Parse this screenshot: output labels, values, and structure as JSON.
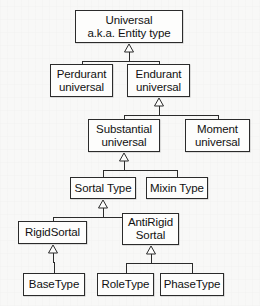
{
  "diagram": {
    "notation": "UML generalization hierarchy",
    "background_color": "#f8f8f7",
    "node_fill_color": "#fdfdfc",
    "line_color": "#2b2b2b",
    "text_color": "#111111",
    "nodes": [
      {
        "id": "universal",
        "lines": [
          "Universal",
          "a.k.a. Entity type"
        ],
        "x": 75,
        "y": 10,
        "w": 108,
        "h": 33,
        "font_size": 11.5
      },
      {
        "id": "perdurant",
        "lines": [
          "Perdurant",
          "universal"
        ],
        "x": 50,
        "y": 64,
        "w": 63,
        "h": 33,
        "font_size": 11.5
      },
      {
        "id": "endurant",
        "lines": [
          "Endurant",
          "universal"
        ],
        "x": 127,
        "y": 64,
        "w": 63,
        "h": 33,
        "font_size": 11.5
      },
      {
        "id": "substantial",
        "lines": [
          "Substantial",
          "universal"
        ],
        "x": 88,
        "y": 119,
        "w": 72,
        "h": 33,
        "font_size": 11.5
      },
      {
        "id": "moment",
        "lines": [
          "Moment",
          "universal"
        ],
        "x": 185,
        "y": 119,
        "w": 65,
        "h": 33,
        "font_size": 11.5
      },
      {
        "id": "sortal-type",
        "lines": [
          "Sortal Type"
        ],
        "x": 70,
        "y": 177,
        "w": 66,
        "h": 22,
        "font_size": 11.5
      },
      {
        "id": "mixin-type",
        "lines": [
          "Mixin Type"
        ],
        "x": 146,
        "y": 177,
        "w": 62,
        "h": 22,
        "font_size": 11.5
      },
      {
        "id": "rigid-sortal",
        "lines": [
          "RigidSortal"
        ],
        "x": 18,
        "y": 221,
        "w": 69,
        "h": 23,
        "font_size": 11.5
      },
      {
        "id": "antirigid-sortal",
        "lines": [
          "AntiRigid",
          "Sortal"
        ],
        "x": 122,
        "y": 213,
        "w": 57,
        "h": 32,
        "font_size": 11.5
      },
      {
        "id": "base-type",
        "lines": [
          "BaseType"
        ],
        "x": 23,
        "y": 273,
        "w": 62,
        "h": 23,
        "font_size": 11.5
      },
      {
        "id": "role-type",
        "lines": [
          "RoleType"
        ],
        "x": 97,
        "y": 273,
        "w": 57,
        "h": 23,
        "font_size": 11.5
      },
      {
        "id": "phase-type",
        "lines": [
          "PhaseType"
        ],
        "x": 160,
        "y": 273,
        "w": 64,
        "h": 23,
        "font_size": 11.5
      }
    ],
    "generalizations": [
      {
        "parent": "universal",
        "children": [
          "perdurant",
          "endurant"
        ]
      },
      {
        "parent": "endurant",
        "children": [
          "substantial",
          "moment"
        ]
      },
      {
        "parent": "substantial",
        "children": [
          "sortal-type",
          "mixin-type"
        ]
      },
      {
        "parent": "sortal-type",
        "children": [
          "rigid-sortal",
          "antirigid-sortal"
        ]
      },
      {
        "parent": "rigid-sortal",
        "children": [
          "base-type"
        ]
      },
      {
        "parent": "antirigid-sortal",
        "children": [
          "role-type",
          "phase-type"
        ]
      }
    ]
  }
}
